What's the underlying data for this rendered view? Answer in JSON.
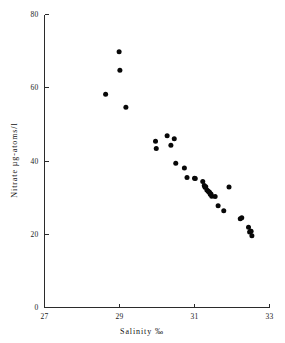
{
  "chart_data": {
    "type": "scatter",
    "title": "",
    "xlabel": "Salinity ‰",
    "ylabel": "Nitrate µg-atoms/l",
    "xlim": [
      27,
      33
    ],
    "ylim": [
      0,
      80
    ],
    "xticks": [
      27,
      29,
      31,
      33
    ],
    "yticks": [
      0,
      20,
      40,
      60,
      80
    ],
    "xtick_labels": [
      "27",
      "29",
      "31",
      "33"
    ],
    "ytick_labels": [
      "0",
      "20",
      "40",
      "60",
      "80"
    ],
    "grid": false,
    "legend": null,
    "marker": "filled-circle",
    "marker_color": "#080808",
    "axis_color": "#2b2b2b",
    "x": [
      28.63,
      28.99,
      29.01,
      29.17,
      29.96,
      29.98,
      30.27,
      30.37,
      30.46,
      30.5,
      30.73,
      30.8,
      31.0,
      31.02,
      31.22,
      31.26,
      31.28,
      31.3,
      31.33,
      31.36,
      31.38,
      31.4,
      31.42,
      31.44,
      31.46,
      31.55,
      31.63,
      31.78,
      31.92,
      32.22,
      32.26,
      32.44,
      32.47,
      32.49,
      32.51,
      32.53
    ],
    "y": [
      58.2,
      69.8,
      64.8,
      54.7,
      45.4,
      43.4,
      46.9,
      44.3,
      46.1,
      39.4,
      38.1,
      35.5,
      35.3,
      35.2,
      34.4,
      33.3,
      32.8,
      33.0,
      32.1,
      31.8,
      31.6,
      31.5,
      30.9,
      31.0,
      30.4,
      30.3,
      27.8,
      26.4,
      32.9,
      24.2,
      24.5,
      21.9,
      20.6,
      20.8,
      20.8,
      19.6
    ],
    "points": [
      {
        "x": 28.63,
        "y": 58.2
      },
      {
        "x": 28.99,
        "y": 69.8
      },
      {
        "x": 29.01,
        "y": 64.8
      },
      {
        "x": 29.17,
        "y": 54.7
      },
      {
        "x": 29.96,
        "y": 45.4
      },
      {
        "x": 29.98,
        "y": 43.4
      },
      {
        "x": 30.27,
        "y": 46.9
      },
      {
        "x": 30.37,
        "y": 44.3
      },
      {
        "x": 30.46,
        "y": 46.1
      },
      {
        "x": 30.5,
        "y": 39.4
      },
      {
        "x": 30.73,
        "y": 38.1
      },
      {
        "x": 30.8,
        "y": 35.5
      },
      {
        "x": 31.0,
        "y": 35.3
      },
      {
        "x": 31.02,
        "y": 35.2
      },
      {
        "x": 31.22,
        "y": 34.4
      },
      {
        "x": 31.26,
        "y": 33.3
      },
      {
        "x": 31.28,
        "y": 32.8
      },
      {
        "x": 31.3,
        "y": 33.0
      },
      {
        "x": 31.33,
        "y": 32.1
      },
      {
        "x": 31.36,
        "y": 31.8
      },
      {
        "x": 31.38,
        "y": 31.6
      },
      {
        "x": 31.4,
        "y": 31.5
      },
      {
        "x": 31.42,
        "y": 30.9
      },
      {
        "x": 31.44,
        "y": 31.0
      },
      {
        "x": 31.46,
        "y": 30.4
      },
      {
        "x": 31.55,
        "y": 30.3
      },
      {
        "x": 31.63,
        "y": 27.8
      },
      {
        "x": 31.78,
        "y": 26.4
      },
      {
        "x": 31.92,
        "y": 32.9
      },
      {
        "x": 32.22,
        "y": 24.2
      },
      {
        "x": 32.26,
        "y": 24.5
      },
      {
        "x": 32.44,
        "y": 21.9
      },
      {
        "x": 32.47,
        "y": 20.6
      },
      {
        "x": 32.49,
        "y": 20.8
      },
      {
        "x": 32.51,
        "y": 20.8
      },
      {
        "x": 32.53,
        "y": 19.6
      }
    ]
  }
}
